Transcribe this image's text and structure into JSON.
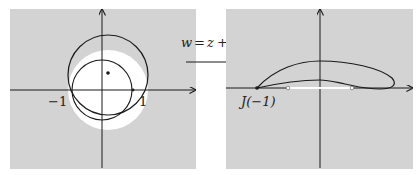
{
  "colors": {
    "panel_bg": "#d3d3d3",
    "disk_fill": "#ffffff",
    "stroke": "#1a1a1a"
  },
  "left_panel": {
    "name": "z-plane",
    "tick_labels": {
      "neg_one": "−1",
      "pos_one": "1"
    },
    "unit_circle_label": "",
    "elements": [
      "unit-circle",
      "offset-circle",
      "center-point",
      "x-axis",
      "y-axis"
    ]
  },
  "mapping": {
    "lhs": "w",
    "eq": "=",
    "z1": "z",
    "plus": "+",
    "numerator": "1",
    "denominator": "z"
  },
  "right_panel": {
    "name": "w-plane",
    "point_label": "J(−1)",
    "elements": [
      "joukowski-airfoil",
      "segment-minus2-to-2",
      "x-axis",
      "y-axis"
    ]
  }
}
